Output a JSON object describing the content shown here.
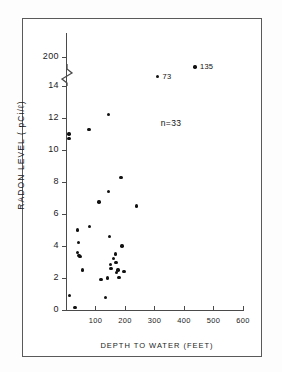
{
  "chart_data": {
    "type": "scatter",
    "title": "",
    "xlabel": "DEPTH TO WATER (FEET)",
    "ylabel": "RADON LEVEL ( pCi/ℓ)",
    "xlim": [
      0,
      600
    ],
    "ylim": [
      0,
      14
    ],
    "grid": false,
    "legend": null,
    "axis_break": {
      "axis": "y",
      "between": [
        14,
        200
      ],
      "symbol": "zigzag"
    },
    "xticks": [
      0,
      100,
      200,
      300,
      400,
      500,
      600
    ],
    "xtick_labels": [
      "0",
      "100",
      "200",
      "300",
      "400",
      "500",
      "600"
    ],
    "yticks": [
      0,
      2,
      4,
      6,
      8,
      10,
      12,
      14,
      200
    ],
    "ytick_labels": [
      "0",
      "2",
      "4",
      "6",
      "8",
      "10",
      "12",
      "14",
      "200"
    ],
    "annotations": [
      {
        "text": "n=33",
        "x": 355,
        "y": 11.6
      }
    ],
    "point_labels": [
      {
        "text": "73",
        "x": 310,
        "y": 73
      },
      {
        "text": "135",
        "x": 437,
        "y": 135
      }
    ],
    "n": 33,
    "series": [
      {
        "name": "wells",
        "points": [
          {
            "x": 10,
            "y": 11.0
          },
          {
            "x": 10,
            "y": 10.7
          },
          {
            "x": 12,
            "y": 0.9
          },
          {
            "x": 30,
            "y": 0.15
          },
          {
            "x": 38,
            "y": 5.0
          },
          {
            "x": 42,
            "y": 4.2
          },
          {
            "x": 40,
            "y": 3.6
          },
          {
            "x": 44,
            "y": 3.4
          },
          {
            "x": 48,
            "y": 3.35
          },
          {
            "x": 55,
            "y": 2.5
          },
          {
            "x": 78,
            "y": 11.3
          },
          {
            "x": 80,
            "y": 5.2
          },
          {
            "x": 112,
            "y": 6.75
          },
          {
            "x": 118,
            "y": 1.9
          },
          {
            "x": 133,
            "y": 0.8
          },
          {
            "x": 140,
            "y": 2.0
          },
          {
            "x": 145,
            "y": 12.2
          },
          {
            "x": 145,
            "y": 7.4
          },
          {
            "x": 148,
            "y": 4.6
          },
          {
            "x": 150,
            "y": 2.85
          },
          {
            "x": 152,
            "y": 2.6
          },
          {
            "x": 160,
            "y": 3.2
          },
          {
            "x": 168,
            "y": 3.5
          },
          {
            "x": 170,
            "y": 2.95
          },
          {
            "x": 172,
            "y": 2.35
          },
          {
            "x": 176,
            "y": 2.5
          },
          {
            "x": 180,
            "y": 2.05
          },
          {
            "x": 186,
            "y": 8.3
          },
          {
            "x": 190,
            "y": 4.0
          },
          {
            "x": 196,
            "y": 2.4
          },
          {
            "x": 238,
            "y": 6.5
          },
          {
            "x": 310,
            "y": 73
          },
          {
            "x": 437,
            "y": 135
          }
        ]
      }
    ]
  }
}
